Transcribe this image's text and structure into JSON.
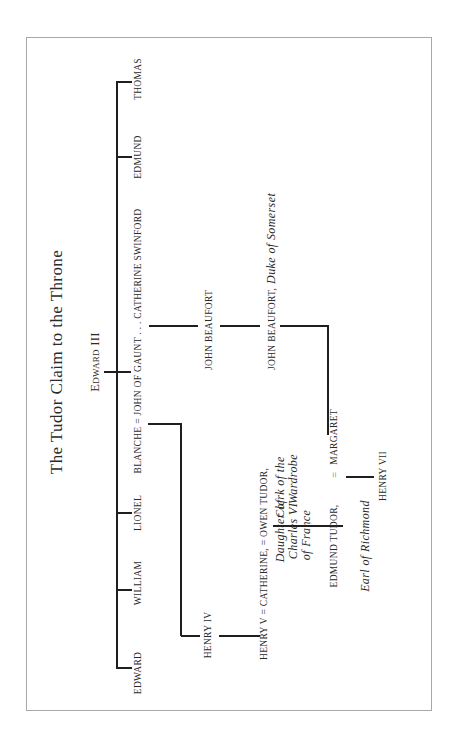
{
  "page": {
    "orientation": "rotated-90-ccw",
    "title": "The Tudor Claim to the Throne"
  },
  "tree": {
    "root": "Edward III",
    "children_of_edward_iii": [
      "EDWARD",
      "WILLIAM",
      "LIONEL",
      "BLANCHE = JOHN OF GAUNT . . . CATHERINE SWINFORD",
      "EDMUND",
      "THOMAS"
    ],
    "lancaster_line": {
      "henry_iv": "HENRY IV",
      "henry_v_row": "HENRY V = CATHERINE, = OWEN TUDOR,",
      "catherine_desc": [
        "Daughter of",
        "Charles VI",
        "of France"
      ],
      "owen_desc": [
        "Clerk of the",
        "Wardrobe"
      ]
    },
    "beaufort_line": {
      "john_beaufort": "JOHN BEAUFORT",
      "john_beaufort_duke_name": "JOHN BEAUFORT,",
      "john_beaufort_duke_title": "Duke of Somerset",
      "margaret": "MARGARET"
    },
    "tudor_line": {
      "edmund_tudor": "EDMUND TUDOR,",
      "edmund_title": "Earl of Richmond",
      "marriage_sign": "=",
      "henry_vii": "HENRY VII"
    }
  },
  "colors": {
    "line": "#1f1f1f",
    "text": "#2a2a2a",
    "frame": "#a8a8a8"
  }
}
